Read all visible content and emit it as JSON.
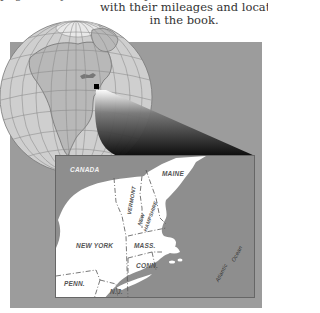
{
  "caption": {
    "line_cut": "page. They are listed alphabetically,",
    "line1": "with their mileages and location",
    "line2": "in the book."
  },
  "globe": {
    "marker": "new-england-location-marker"
  },
  "inset_map": {
    "labels": {
      "canada": "CANADA",
      "maine": "MAINE",
      "vermont": "VERMONT",
      "new_hampshire_1": "NEW",
      "new_hampshire_2": "HAMPSHIRE",
      "new_york": "NEW YORK",
      "mass": "MASS.",
      "conn": "CONN.",
      "penn": "PENN.",
      "nj": "N.J.",
      "atlantic": "Atlantic",
      "ocean": "Ocean"
    }
  },
  "colors": {
    "panel": "#9c9c9c",
    "water": "#8e8e8e",
    "land": "#ffffff",
    "globe_land": "#b8b8b8",
    "globe_water": "#cfcfcf"
  }
}
